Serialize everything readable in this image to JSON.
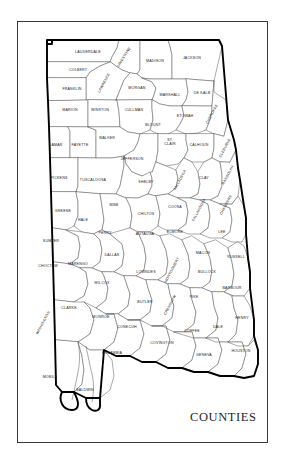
{
  "map": {
    "title": "COUNTIES",
    "state": "Alabama",
    "frame_color": "#3a3a3a",
    "border_color": "#000000",
    "county_line_color": "#555555",
    "background": "#ffffff",
    "counties": [
      {
        "name": "LAUDERDALE",
        "x": 88,
        "y": 52,
        "rot": 0
      },
      {
        "name": "LIMESTONE",
        "x": 124,
        "y": 57,
        "rot": -58
      },
      {
        "name": "MADISON",
        "x": 155,
        "y": 61,
        "rot": 0
      },
      {
        "name": "JACKSON",
        "x": 192,
        "y": 58,
        "rot": 0
      },
      {
        "name": "COLBERT",
        "x": 78,
        "y": 70,
        "rot": 0
      },
      {
        "name": "LAWRENCE",
        "x": 104,
        "y": 83,
        "rot": -62
      },
      {
        "name": "FRANKLIN",
        "x": 72,
        "y": 89,
        "rot": 0
      },
      {
        "name": "MORGAN",
        "x": 137,
        "y": 88,
        "rot": 0
      },
      {
        "name": "MARSHALL",
        "x": 170,
        "y": 95,
        "rot": 0
      },
      {
        "name": "DE KALB",
        "x": 202,
        "y": 93,
        "rot": 0
      },
      {
        "name": "MARION",
        "x": 70,
        "y": 110,
        "rot": 0
      },
      {
        "name": "WINSTON",
        "x": 100,
        "y": 110,
        "rot": 0
      },
      {
        "name": "CULLMAN",
        "x": 134,
        "y": 110,
        "rot": 0
      },
      {
        "name": "ETOWAH",
        "x": 185,
        "y": 116,
        "rot": 0
      },
      {
        "name": "CHEROKEE",
        "x": 212,
        "y": 114,
        "rot": -62
      },
      {
        "name": "BLOUNT",
        "x": 153,
        "y": 125,
        "rot": 0
      },
      {
        "name": "WALKER",
        "x": 107,
        "y": 138,
        "rot": 0
      },
      {
        "name": "LAMAR",
        "x": 56,
        "y": 145,
        "rot": 0
      },
      {
        "name": "FAYETTE",
        "x": 80,
        "y": 145,
        "rot": 0
      },
      {
        "name": "ST. CLAIR",
        "x": 170,
        "y": 143,
        "rot": 0,
        "lines": [
          "ST.",
          "CLAIR"
        ]
      },
      {
        "name": "CALHOUN",
        "x": 199,
        "y": 145,
        "rot": 0
      },
      {
        "name": "CLEBURNE",
        "x": 225,
        "y": 148,
        "rot": -62
      },
      {
        "name": "JEFFERSON",
        "x": 132,
        "y": 159,
        "rot": 0
      },
      {
        "name": "PICKENS",
        "x": 59,
        "y": 178,
        "rot": 0
      },
      {
        "name": "TUSCALOOSA",
        "x": 93,
        "y": 180,
        "rot": 0
      },
      {
        "name": "SHELBY",
        "x": 146,
        "y": 182,
        "rot": 0
      },
      {
        "name": "TALLADEGA",
        "x": 180,
        "y": 180,
        "rot": -62
      },
      {
        "name": "CLAY",
        "x": 204,
        "y": 178,
        "rot": 0
      },
      {
        "name": "RANDOLPH",
        "x": 228,
        "y": 175,
        "rot": -62
      },
      {
        "name": "GREENE",
        "x": 63,
        "y": 211,
        "rot": 0
      },
      {
        "name": "BIBB",
        "x": 114,
        "y": 205,
        "rot": 0
      },
      {
        "name": "CHILTON",
        "x": 146,
        "y": 214,
        "rot": 0
      },
      {
        "name": "COOSA",
        "x": 175,
        "y": 207,
        "rot": 0
      },
      {
        "name": "TALLAPOOSA",
        "x": 199,
        "y": 210,
        "rot": -62
      },
      {
        "name": "CHAMBERS",
        "x": 226,
        "y": 205,
        "rot": -62
      },
      {
        "name": "HALE",
        "x": 83,
        "y": 220,
        "rot": 0
      },
      {
        "name": "SUMTER",
        "x": 51,
        "y": 241,
        "rot": 0
      },
      {
        "name": "PERRY",
        "x": 105,
        "y": 233,
        "rot": 0
      },
      {
        "name": "AUTAUGA",
        "x": 145,
        "y": 234,
        "rot": 0
      },
      {
        "name": "ELMORE",
        "x": 175,
        "y": 232,
        "rot": 0
      },
      {
        "name": "LEE",
        "x": 222,
        "y": 232,
        "rot": 0
      },
      {
        "name": "CHOCTAW",
        "x": 48,
        "y": 266,
        "rot": 0
      },
      {
        "name": "MARENGO",
        "x": 78,
        "y": 264,
        "rot": 0
      },
      {
        "name": "DALLAS",
        "x": 112,
        "y": 255,
        "rot": 0
      },
      {
        "name": "MACON",
        "x": 203,
        "y": 253,
        "rot": 0
      },
      {
        "name": "RUSSELL",
        "x": 236,
        "y": 257,
        "rot": 0
      },
      {
        "name": "LOWNDES",
        "x": 146,
        "y": 272,
        "rot": 0
      },
      {
        "name": "MONTGOMERY",
        "x": 172,
        "y": 270,
        "rot": -62
      },
      {
        "name": "BULLOCK",
        "x": 207,
        "y": 272,
        "rot": 0
      },
      {
        "name": "WILCOX",
        "x": 102,
        "y": 283,
        "rot": 0
      },
      {
        "name": "BARBOUR",
        "x": 232,
        "y": 288,
        "rot": 0
      },
      {
        "name": "CLARKE",
        "x": 69,
        "y": 308,
        "rot": 0
      },
      {
        "name": "MONROE",
        "x": 101,
        "y": 317,
        "rot": 0
      },
      {
        "name": "BUTLER",
        "x": 145,
        "y": 302,
        "rot": 0
      },
      {
        "name": "CRENSHAW",
        "x": 170,
        "y": 305,
        "rot": -62
      },
      {
        "name": "PIKE",
        "x": 194,
        "y": 297,
        "rot": 0
      },
      {
        "name": "WASHINGTON",
        "x": 43,
        "y": 323,
        "rot": -62
      },
      {
        "name": "CONECUH",
        "x": 127,
        "y": 327,
        "rot": 0
      },
      {
        "name": "COFFEE",
        "x": 192,
        "y": 331,
        "rot": 0
      },
      {
        "name": "DALE",
        "x": 218,
        "y": 327,
        "rot": 0
      },
      {
        "name": "HENRY",
        "x": 242,
        "y": 318,
        "rot": 0
      },
      {
        "name": "ESCAMBIA",
        "x": 112,
        "y": 353,
        "rot": 0
      },
      {
        "name": "COVINGTON",
        "x": 162,
        "y": 343,
        "rot": 0
      },
      {
        "name": "GENEVA",
        "x": 204,
        "y": 355,
        "rot": 0
      },
      {
        "name": "HOUSTON",
        "x": 241,
        "y": 351,
        "rot": 0
      },
      {
        "name": "MOBILE",
        "x": 50,
        "y": 377,
        "rot": 0
      },
      {
        "name": "BALDWIN",
        "x": 85,
        "y": 390,
        "rot": 0
      }
    ]
  }
}
